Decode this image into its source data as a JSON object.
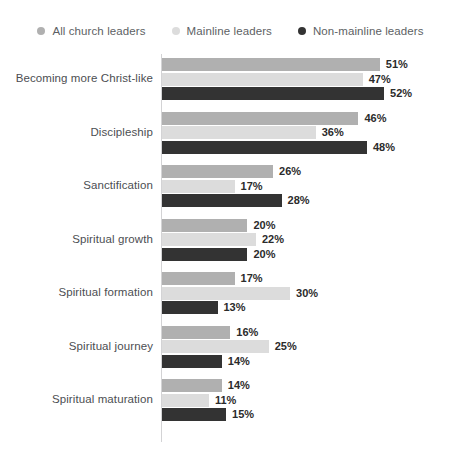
{
  "chart_data": {
    "type": "bar",
    "orientation": "horizontal",
    "title": "",
    "xlabel": "",
    "ylabel": "",
    "grid": false,
    "legend_position": "top",
    "xlim": [
      0,
      55
    ],
    "value_suffix": "%",
    "categories": [
      "Becoming more Christ-like",
      "Discipleship",
      "Sanctification",
      "Spiritual growth",
      "Spiritual formation",
      "Spiritual journey",
      "Spiritual maturation"
    ],
    "series": [
      {
        "name": "All church leaders",
        "color": "#b0b0b0",
        "values": [
          51,
          46,
          26,
          20,
          17,
          16,
          14
        ],
        "labels": [
          "51%",
          "46%",
          "26%",
          "20%",
          "17%",
          "16%",
          "14%"
        ]
      },
      {
        "name": "Mainline leaders",
        "color": "#dcdcdc",
        "values": [
          47,
          36,
          17,
          22,
          30,
          25,
          11
        ],
        "labels": [
          "47%",
          "36%",
          "17%",
          "22%",
          "30%",
          "25%",
          "11%"
        ]
      },
      {
        "name": "Non-mainline leaders",
        "color": "#333333",
        "values": [
          52,
          48,
          28,
          20,
          13,
          14,
          15
        ],
        "labels": [
          "52%",
          "48%",
          "28%",
          "20%",
          "13%",
          "14%",
          "15%"
        ]
      }
    ]
  },
  "legend": {
    "items": [
      {
        "label": "All church leaders",
        "color": "#b0b0b0",
        "marker": "circle-marker"
      },
      {
        "label": "Mainline leaders",
        "color": "#dcdcdc",
        "marker": "circle-marker"
      },
      {
        "label": "Non-mainline leaders",
        "color": "#333333",
        "marker": "circle-marker"
      }
    ]
  },
  "axis": {
    "line_color": "#d3d3d5"
  }
}
